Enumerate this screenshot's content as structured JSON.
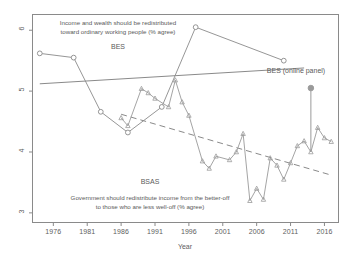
{
  "chart_data": {
    "type": "line",
    "title": "",
    "xlabel": "Year",
    "ylabel": "",
    "xlim": [
      1973,
      2018
    ],
    "ylim": [
      2.85,
      6.25
    ],
    "grid": false,
    "legend_position": "in-plot annotations",
    "xticks": [
      1976,
      1981,
      1986,
      1991,
      1996,
      2001,
      2006,
      2011,
      2016
    ],
    "yticks": [
      3,
      4,
      5,
      6
    ],
    "series": [
      {
        "name": "BES",
        "marker": "open-circle",
        "line_style": "solid",
        "x": [
          1974,
          1979,
          1983,
          1987,
          1992,
          1997,
          2010
        ],
        "values": [
          5.62,
          5.55,
          4.66,
          4.32,
          4.74,
          6.05,
          5.5
        ]
      },
      {
        "name": "BSAS",
        "marker": "triangle",
        "line_style": "solid",
        "x": [
          1986,
          1987,
          1989,
          1990,
          1991,
          1993,
          1994,
          1995,
          1996,
          1998,
          1999,
          2000,
          2002,
          2003,
          2004,
          2005,
          2006,
          2007,
          2008,
          2009,
          2010,
          2011,
          2012,
          2013,
          2014,
          2015,
          2016,
          2017
        ],
        "values": [
          4.56,
          4.43,
          5.04,
          4.97,
          4.88,
          4.74,
          5.18,
          4.82,
          4.6,
          3.85,
          3.73,
          3.93,
          3.87,
          4.0,
          4.3,
          3.2,
          3.4,
          3.22,
          3.9,
          3.78,
          3.55,
          3.82,
          4.1,
          4.18,
          4.0,
          4.4,
          4.23,
          4.17
        ]
      },
      {
        "name": "BES (online panel)",
        "marker": "filled-circle",
        "line_style": "none",
        "x": [
          2014
        ],
        "values": [
          5.05
        ]
      }
    ],
    "trend_lines": [
      {
        "name": "BES trend",
        "style": "solid",
        "x": [
          1974,
          2013
        ],
        "values": [
          5.12,
          5.38
        ]
      },
      {
        "name": "BSAS trend",
        "style": "dashed",
        "x": [
          1986,
          2017
        ],
        "values": [
          4.62,
          3.62
        ]
      }
    ],
    "connector_lines": [
      {
        "name": "online-panel-connector",
        "x": [
          2014,
          2014
        ],
        "values": [
          5.05,
          4.0
        ]
      }
    ],
    "annotations": [
      {
        "name": "bes-question",
        "line1": "Income and wealth should be redistributed",
        "line2": "toward ordinary working people (% agree)"
      },
      {
        "name": "bsas-question",
        "line1": "Government should redistribute income from the better-off",
        "line2": "to those who are less well-off (% agree)"
      }
    ],
    "series_labels": {
      "bes": "BES",
      "bsas": "BSAS",
      "bes_online": "BES (online panel)"
    },
    "colors": {
      "bes_line": "#8a8a8a",
      "bsas_line": "#9a9a9a",
      "trend": "#8a8a8a",
      "axis": "#8a8a8a",
      "text": "#5a5a5a",
      "online_marker": "#9a9a9a"
    }
  }
}
